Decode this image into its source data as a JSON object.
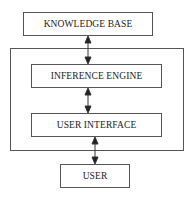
{
  "diagram": {
    "type": "block-diagram",
    "nodes": {
      "knowledge_base": "KNOWLEDGE BASE",
      "inference_engine": "INFERENCE ENGINE",
      "user_interface": "USER INTERFACE",
      "user": "USER"
    },
    "edges": [
      {
        "from": "knowledge_base",
        "to": "inference_engine",
        "direction": "bidirectional"
      },
      {
        "from": "inference_engine",
        "to": "user_interface",
        "direction": "bidirectional"
      },
      {
        "from": "user_interface",
        "to": "user",
        "direction": "bidirectional"
      }
    ],
    "group": {
      "contains": [
        "inference_engine",
        "user_interface"
      ]
    },
    "colors": {
      "line": "#555555",
      "text": "#222222",
      "background": "#ffffff"
    }
  }
}
